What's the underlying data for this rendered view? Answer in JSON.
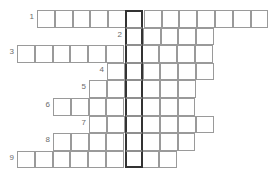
{
  "puzzle": {
    "title": "Crossword Grid",
    "type": "crossword",
    "width": 280,
    "height": 185,
    "cell_size": 17.8,
    "row_height": 17.6,
    "colors": {
      "background": "#ffffff",
      "cell_fill": "#ffffff",
      "cell_border": "#9a9a9a",
      "highlight_border": "#333333",
      "clue_number": "#6b6b6b"
    },
    "highlight_column": {
      "name": "solution-column",
      "x": 125.0,
      "width": 17.8,
      "start_row": 1,
      "end_row": 9
    },
    "rows": [
      {
        "number": "1",
        "y": 10.0,
        "x": 37.0,
        "cells": 13,
        "num_x": 28.0,
        "num_y": 13.0,
        "highlight_index": 5
      },
      {
        "number": "2",
        "y": 27.6,
        "x": 125.0,
        "cells": 5,
        "num_x": 116.0,
        "num_y": 30.6,
        "highlight_index": 0
      },
      {
        "number": "3",
        "y": 45.2,
        "x": 17.0,
        "cells": 11,
        "num_x": 8.0,
        "num_y": 48.2,
        "highlight_index": 6
      },
      {
        "number": "4",
        "y": 62.8,
        "x": 107.0,
        "cells": 6,
        "num_x": 98.0,
        "num_y": 65.8,
        "highlight_index": 1
      },
      {
        "number": "5",
        "y": 80.4,
        "x": 89.0,
        "cells": 6,
        "num_x": 80.0,
        "num_y": 83.4,
        "highlight_index": 2
      },
      {
        "number": "6",
        "y": 98.0,
        "x": 53.0,
        "cells": 8,
        "num_x": 44.0,
        "num_y": 101.0,
        "highlight_index": 4
      },
      {
        "number": "7",
        "y": 115.6,
        "x": 89.0,
        "cells": 7,
        "num_x": 80.0,
        "num_y": 118.6,
        "highlight_index": 2
      },
      {
        "number": "8",
        "y": 133.2,
        "x": 53.0,
        "cells": 8,
        "num_x": 44.0,
        "num_y": 136.2,
        "highlight_index": 4
      },
      {
        "number": "9",
        "y": 150.8,
        "x": 17.0,
        "cells": 9,
        "num_x": 8.0,
        "num_y": 153.8,
        "highlight_index": 6
      }
    ]
  }
}
